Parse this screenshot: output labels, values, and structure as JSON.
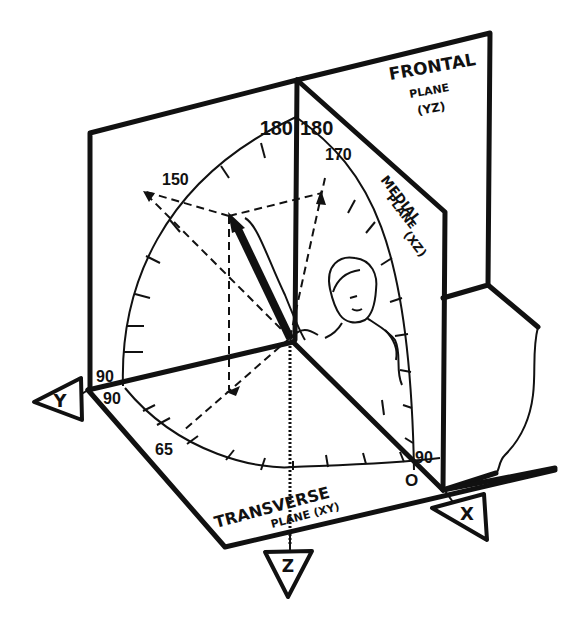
{
  "diagram": {
    "planes": {
      "frontal": {
        "line1": "FRONTAL",
        "line2": "PLANE",
        "line3": "(YZ)"
      },
      "medial": {
        "line1": "MEDIAL",
        "line2": "PLANE",
        "line3": "(XZ)"
      },
      "transverse": {
        "line1": "TRANSVERSE",
        "line2": "PLANE (XY)"
      }
    },
    "axes": {
      "x": "X",
      "y": "Y",
      "z": "Z"
    },
    "scale_labels": {
      "frontal_top": "180",
      "medial_top": "180",
      "label_150": "150",
      "label_170": "170",
      "frontal_left": "90",
      "transverse_left": "90",
      "label_65": "65",
      "medial_right": "90",
      "origin": "O"
    },
    "colors": {
      "ink": "#111111",
      "paper": "#ffffff"
    }
  }
}
